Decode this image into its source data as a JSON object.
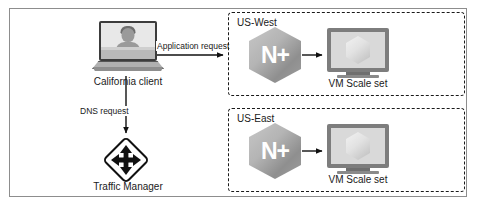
{
  "figure": {
    "background_color": "#ffffff",
    "frame_color": "#8d8d8d"
  },
  "client": {
    "label": "California client",
    "icon": "laptop-with-user-icon"
  },
  "traffic_manager": {
    "label": "Traffic Manager",
    "icon": "four-way-arrow-diamond-icon"
  },
  "edges": [
    {
      "id": "application-request",
      "label": "Application request",
      "from": "California client",
      "to": "US-West"
    },
    {
      "id": "dns-request",
      "label": "DNS request",
      "from": "California client",
      "to": "Traffic Manager"
    }
  ],
  "regions": [
    {
      "id": "us-west",
      "title": "US-West",
      "gateway": {
        "label": "N+",
        "icon": "nginx-plus-hexagon-icon"
      },
      "workload": {
        "label": "VM Scale set",
        "icon": "vm-scale-set-monitor-icon"
      }
    },
    {
      "id": "us-east",
      "title": "US-East",
      "gateway": {
        "label": "N+",
        "icon": "nginx-plus-hexagon-icon"
      },
      "workload": {
        "label": "VM Scale set",
        "icon": "vm-scale-set-monitor-icon"
      }
    }
  ],
  "colors": {
    "line": "#111111",
    "dashed_border": "#1a1a1a",
    "nginx_gray": "#9d9d9d",
    "monitor_gray": "#7d7d7d",
    "text": "#1a1a1a"
  }
}
